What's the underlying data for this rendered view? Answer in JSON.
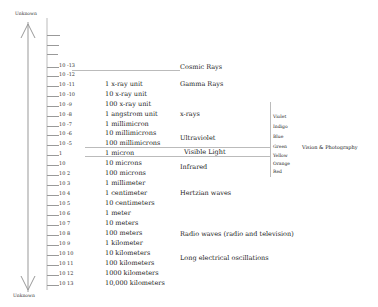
{
  "axis": {
    "top_label": "Unknown",
    "bottom_label": "Unknown"
  },
  "rows": [
    {
      "exp": "10 -13",
      "unit": ""
    },
    {
      "exp": "10 -12",
      "unit": ""
    },
    {
      "exp": "10 -11",
      "unit": "1 x-ray unit"
    },
    {
      "exp": "10 -10",
      "unit": "10 x-ray unit"
    },
    {
      "exp": "10 -9",
      "unit": "100 x-ray unit"
    },
    {
      "exp": "10 -8",
      "unit": "1 angstrom unit"
    },
    {
      "exp": "10 -7",
      "unit": "1 millimicron"
    },
    {
      "exp": "10 -6",
      "unit": "10 millimicrons"
    },
    {
      "exp": "10 -5",
      "unit": "100 millimicrons"
    },
    {
      "exp": "1",
      "unit": "1 micron"
    },
    {
      "exp": "10",
      "unit": "10 microns"
    },
    {
      "exp": "10 2",
      "unit": "100 microns"
    },
    {
      "exp": "10 3",
      "unit": "1 millimeter"
    },
    {
      "exp": "10 4",
      "unit": "1 centimeter"
    },
    {
      "exp": "10 5",
      "unit": "10 centimeters"
    },
    {
      "exp": "10 6",
      "unit": "1 meter"
    },
    {
      "exp": "10 7",
      "unit": "10 meters"
    },
    {
      "exp": "10 8",
      "unit": "100 meters"
    },
    {
      "exp": "10 9",
      "unit": "1 kilometer"
    },
    {
      "exp": "10 10",
      "unit": "10 kilometers"
    },
    {
      "exp": "10 11",
      "unit": "100 kilometers"
    },
    {
      "exp": "10 12",
      "unit": "1000 kilometers"
    },
    {
      "exp": "10 13",
      "unit": "10,000 kilometers"
    }
  ],
  "bands": {
    "cosmic": "Cosmic Rays",
    "gamma": "Gamma Rays",
    "xrays": "x-rays",
    "uv": "Ultraviolet",
    "visible": "Visible Light",
    "infrared": "Infrared",
    "hertzian": "Hertzian waves",
    "radio": "Radio waves (radio and television)",
    "long": "Long electrical oscillations"
  },
  "colors": [
    "Violet",
    "Indigo",
    "Blue",
    "Green",
    "Yellow",
    "Orange",
    "Red"
  ],
  "vision_label": "Vision & Photography"
}
